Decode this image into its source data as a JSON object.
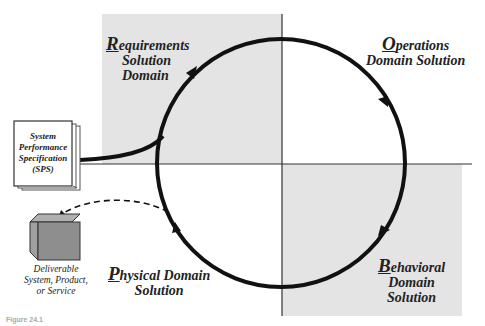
{
  "colors": {
    "quadrant_shade": "#e4e4e4",
    "stroke": "#111111",
    "axis": "#333333",
    "cube_front": "#8e8e8e",
    "cube_top": "#b0b0b0",
    "cube_side": "#a0a0a0"
  },
  "quadrants": {
    "requirements": {
      "cap": "R",
      "line1_rest": "equirements",
      "line2": "Solution",
      "line3": "Domain"
    },
    "operations": {
      "cap": "O",
      "line1_rest": "perations",
      "line2": "Domain Solution"
    },
    "behavioral": {
      "cap": "B",
      "line1_rest": "ehavioral",
      "line2": "Domain",
      "line3": "Solution"
    },
    "physical": {
      "cap": "P",
      "line1_rest": "hysical Domain",
      "line2": "Solution"
    }
  },
  "sps_document": {
    "icon": "book-icon",
    "lines": [
      "System",
      "Performance",
      "Specification",
      "(SPS)"
    ]
  },
  "deliverable": {
    "icon": "cube-icon",
    "lines": [
      "Deliverable",
      "System, Product,",
      "or Service"
    ]
  },
  "cycle": {
    "direction": "clockwise",
    "arrow_icons": [
      "arrowhead-requirements",
      "arrowhead-operations",
      "arrowhead-behavioral",
      "arrowhead-physical"
    ]
  },
  "caption": "Figure 24.1"
}
